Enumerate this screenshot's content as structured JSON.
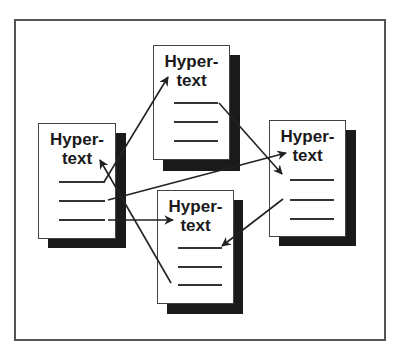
{
  "diagram": {
    "type": "hypertext-link-diagram",
    "colors": {
      "frame": "#555555",
      "shadow": "#1a1a1a",
      "doc_border": "#444444",
      "text": "#1a1a1a",
      "arrow": "#222222"
    },
    "documents": [
      {
        "id": "doc-left",
        "line1": "Hyper-",
        "line2": "text",
        "x": 38,
        "y": 123,
        "w": 78,
        "h": 116
      },
      {
        "id": "doc-top",
        "line1": "Hyper-",
        "line2": "text",
        "x": 153,
        "y": 45,
        "w": 77,
        "h": 115
      },
      {
        "id": "doc-right",
        "line1": "Hyper-",
        "line2": "text",
        "x": 269,
        "y": 120,
        "w": 77,
        "h": 117
      },
      {
        "id": "doc-bottom",
        "line1": "Hyper-",
        "line2": "text",
        "x": 157,
        "y": 190,
        "w": 77,
        "h": 114
      }
    ],
    "links": [
      {
        "from": "doc-left",
        "to": "doc-top",
        "x1": 104,
        "y1": 182,
        "x2": 168,
        "y2": 77
      },
      {
        "from": "doc-bottom",
        "to": "doc-left",
        "x1": 171,
        "y1": 283,
        "x2": 100,
        "y2": 160
      },
      {
        "from": "doc-left",
        "to": "doc-right",
        "x1": 108,
        "y1": 200,
        "x2": 286,
        "y2": 153
      },
      {
        "from": "doc-left",
        "to": "doc-bottom",
        "x1": 108,
        "y1": 220,
        "x2": 173,
        "y2": 220
      },
      {
        "from": "doc-top",
        "to": "doc-right",
        "x1": 219,
        "y1": 103,
        "x2": 282,
        "y2": 174
      },
      {
        "from": "doc-right",
        "to": "doc-bottom",
        "x1": 283,
        "y1": 199,
        "x2": 222,
        "y2": 246
      }
    ]
  }
}
